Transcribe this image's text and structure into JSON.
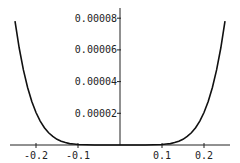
{
  "chart_data": {
    "type": "line",
    "title": "",
    "xlabel": "",
    "ylabel": "",
    "xlim": [
      -0.26,
      0.27
    ],
    "ylim": [
      0,
      9e-05
    ],
    "grid": false,
    "legend": null,
    "x_ticks": [
      {
        "value": -0.2,
        "label": "-0.2"
      },
      {
        "value": -0.1,
        "label": "-0.1"
      },
      {
        "value": 0.1,
        "label": "0.1"
      },
      {
        "value": 0.2,
        "label": "0.2"
      }
    ],
    "y_ticks": [
      {
        "value": 2e-05,
        "label": "0.00002"
      },
      {
        "value": 4e-05,
        "label": "0.00004"
      },
      {
        "value": 6e-05,
        "label": "0.00006"
      },
      {
        "value": 8e-05,
        "label": "0.00008"
      }
    ],
    "series": [
      {
        "name": "f(x)",
        "x": [
          -0.25,
          -0.24,
          -0.23,
          -0.22,
          -0.21,
          -0.2,
          -0.19,
          -0.18,
          -0.17,
          -0.16,
          -0.15,
          -0.14,
          -0.13,
          -0.12,
          -0.11,
          -0.1,
          -0.08,
          -0.06,
          -0.04,
          -0.02,
          0,
          0.02,
          0.04,
          0.06,
          0.08,
          0.1,
          0.11,
          0.12,
          0.13,
          0.14,
          0.15,
          0.16,
          0.17,
          0.18,
          0.19,
          0.2,
          0.21,
          0.22,
          0.23,
          0.24,
          0.25
        ],
        "y": [
          7.81e-05,
          6.12e-05,
          4.74e-05,
          3.63e-05,
          2.74e-05,
          2.05e-05,
          1.51e-05,
          1.09e-05,
          7.7e-06,
          5.4e-06,
          3.6e-06,
          2.4e-06,
          1.5e-06,
          9e-07,
          6e-07,
          3e-07,
          1e-07,
          0.0,
          0.0,
          0.0,
          0.0,
          0.0,
          0.0,
          0.0,
          1e-07,
          3e-07,
          6e-07,
          9e-07,
          1.5e-06,
          2.4e-06,
          3.6e-06,
          5.4e-06,
          7.7e-06,
          1.09e-05,
          1.51e-05,
          2.05e-05,
          2.74e-05,
          3.63e-05,
          4.74e-05,
          6.12e-05,
          7.81e-05
        ]
      }
    ]
  }
}
